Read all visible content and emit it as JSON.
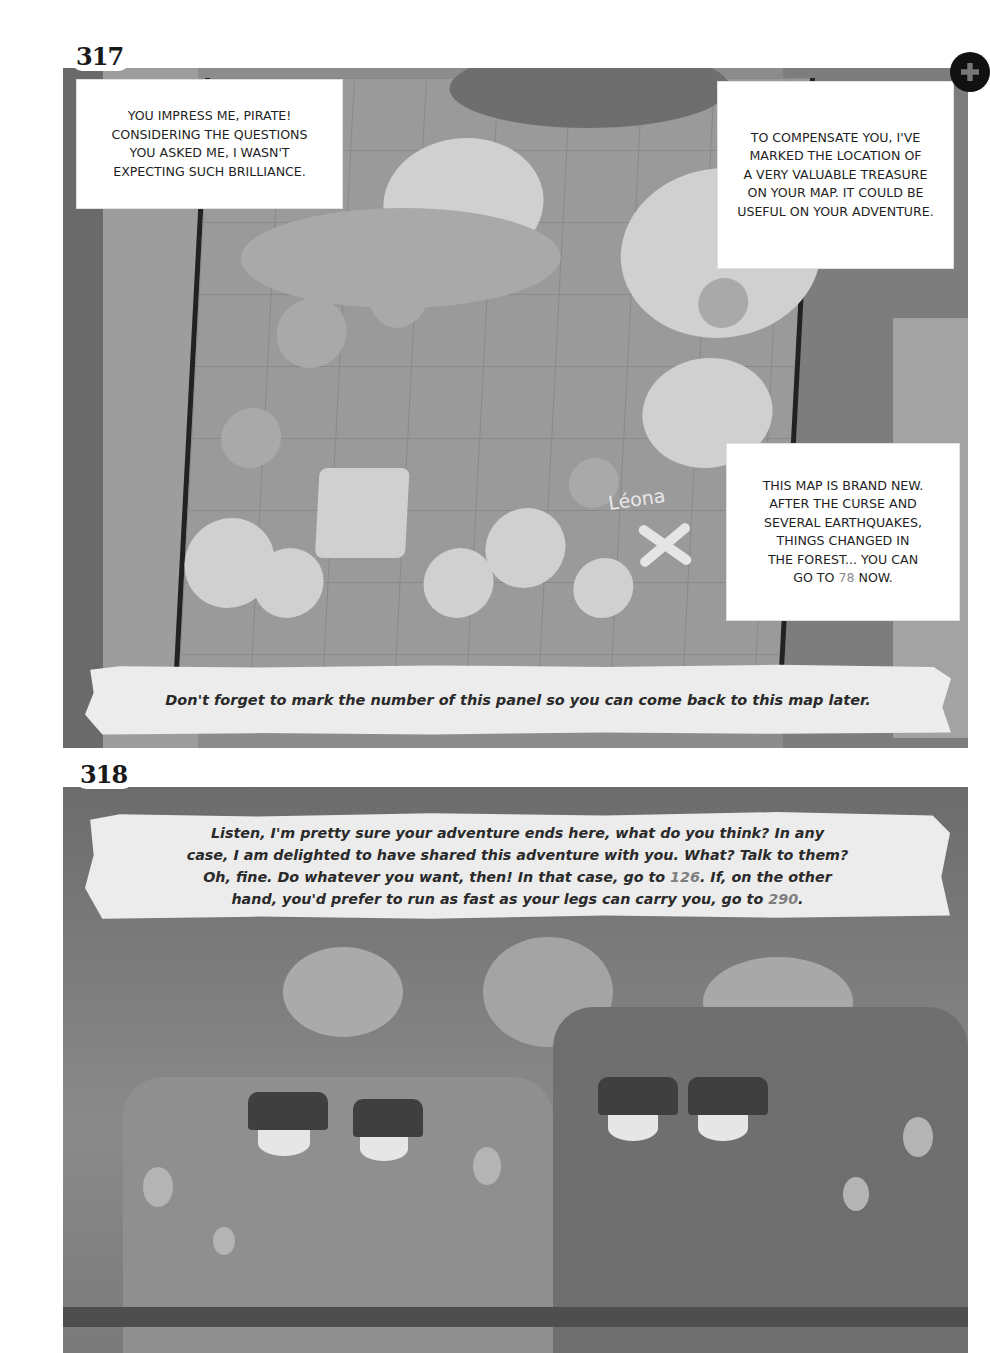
{
  "page": {
    "corner_icon": "puzzle-piece-icon"
  },
  "panels": [
    {
      "number": "317",
      "captions": [
        {
          "id": "impress",
          "lines": [
            "YOU IMPRESS ME, PIRATE!",
            "CONSIDERING THE QUESTIONS",
            "YOU ASKED ME, I WASN'T",
            "EXPECTING SUCH BRILLIANCE."
          ]
        },
        {
          "id": "compensate",
          "lines": [
            "TO COMPENSATE YOU, I'VE",
            "MARKED THE LOCATION OF",
            "A VERY VALUABLE TREASURE",
            "ON YOUR MAP. IT COULD BE",
            "USEFUL ON YOUR ADVENTURE."
          ]
        },
        {
          "id": "brand-new",
          "lines": [
            "THIS MAP IS BRAND NEW.",
            "AFTER THE CURSE AND",
            "SEVERAL EARTHQUAKES,",
            "THINGS CHANGED IN",
            "THE FOREST... YOU CAN"
          ],
          "last_line_prefix": "GO TO ",
          "link_number": "78",
          "last_line_suffix": " NOW."
        }
      ],
      "map": {
        "location_label": "Léona",
        "marker": "x-mark"
      },
      "footer_note": "Don't forget to mark the number of this panel so you can come back to this map later."
    },
    {
      "number": "318",
      "narration": {
        "line1": "Listen, I'm pretty sure your adventure ends here, what do you think? In any",
        "line2": "case, I am delighted to have shared this adventure with you. What? Talk to them?",
        "line3_prefix": "Oh, fine. Do whatever you want, then! In that case, go to ",
        "link_a": "126",
        "line3_suffix": ". If, on the other",
        "line4_prefix": "hand, you'd prefer to run as fast as your legs can carry you, go to ",
        "link_b": "290",
        "line4_suffix": "."
      }
    }
  ]
}
